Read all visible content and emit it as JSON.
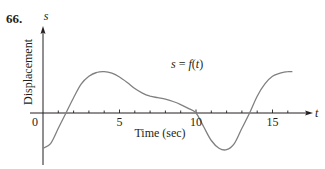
{
  "problem_number": "66.",
  "chart_data": {
    "type": "line",
    "title": "",
    "xlabel": "Time (sec)",
    "ylabel": "Displacement",
    "x_axis_var": "t",
    "y_axis_var": "s",
    "annotation": "s = f(t)",
    "xticks": [
      0,
      1,
      2,
      3,
      4,
      5,
      6,
      7,
      8,
      9,
      10,
      11,
      12,
      13,
      14,
      15,
      16
    ],
    "xtick_labels": [
      "0",
      "5",
      "10",
      "15"
    ],
    "xlim": [
      0,
      16.5
    ],
    "grid": false,
    "series": [
      {
        "name": "s = f(t)",
        "x": [
          0,
          0.5,
          1,
          1.5,
          2,
          2.5,
          3,
          3.5,
          4,
          4.5,
          5,
          5.5,
          6,
          6.5,
          7,
          7.5,
          8,
          8.5,
          9,
          9.5,
          10,
          10.5,
          11,
          11.5,
          12,
          12.5,
          13,
          13.5,
          14,
          14.5,
          15,
          15.5,
          16,
          16.3
        ],
        "y": [
          -2.3,
          -2.0,
          -1.0,
          0.0,
          1.0,
          1.9,
          2.4,
          2.65,
          2.7,
          2.6,
          2.35,
          2.0,
          1.6,
          1.3,
          1.1,
          1.0,
          0.9,
          0.75,
          0.55,
          0.3,
          0.0,
          -0.9,
          -1.8,
          -2.3,
          -2.4,
          -2.0,
          -1.0,
          0.0,
          1.1,
          1.9,
          2.4,
          2.6,
          2.7,
          2.7
        ]
      }
    ]
  },
  "colors": {
    "axis": "#231f20",
    "curve": "#808080",
    "background": "#ffffff"
  }
}
